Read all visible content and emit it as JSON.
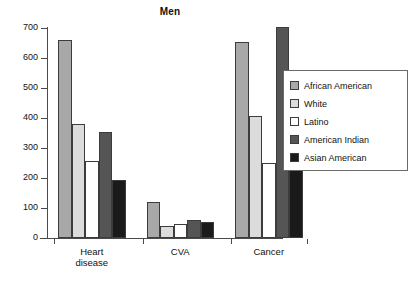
{
  "chart_data": {
    "type": "bar",
    "title": "Men",
    "xlabel": "",
    "ylabel": "",
    "ylim": [
      0,
      700
    ],
    "yticks": [
      0,
      100,
      200,
      300,
      400,
      500,
      600,
      700
    ],
    "grid": false,
    "legend_position": "right",
    "categories": [
      "Heart disease",
      "CVA",
      "Cancer"
    ],
    "category_lines": [
      [
        "Heart",
        "disease"
      ],
      [
        "CVA"
      ],
      [
        "Cancer"
      ]
    ],
    "series": [
      {
        "name": "African American",
        "color": "#a8a8a8",
        "values": [
          660,
          120,
          655
        ]
      },
      {
        "name": "White",
        "color": "#dcdcdc",
        "values": [
          380,
          40,
          408
        ]
      },
      {
        "name": "Latino",
        "color": "#ffffff",
        "values": [
          258,
          48,
          250
        ]
      },
      {
        "name": "American Indian",
        "color": "#555555",
        "values": [
          352,
          60,
          702
        ]
      },
      {
        "name": "Asian American",
        "color": "#1a1a1a",
        "values": [
          195,
          52,
          247
        ]
      }
    ]
  },
  "legend": {
    "items": [
      {
        "label": "African American"
      },
      {
        "label": "White"
      },
      {
        "label": "Latino"
      },
      {
        "label": "American Indian"
      },
      {
        "label": "Asian American"
      }
    ]
  },
  "axis": {
    "y_tick_labels": [
      "700",
      "600",
      "500",
      "400",
      "300",
      "200",
      "100",
      "0"
    ]
  }
}
